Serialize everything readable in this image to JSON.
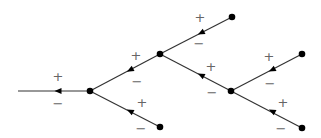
{
  "diagram": {
    "type": "binary-tree-signed-edges",
    "colors": {
      "edge": "#333333",
      "node": "#000000",
      "label": "#666666",
      "background": "#ffffff"
    },
    "nodes": [
      {
        "id": "root",
        "x": 90,
        "y": 91
      },
      {
        "id": "B",
        "x": 160,
        "y": 54
      },
      {
        "id": "C",
        "x": 231,
        "y": 91
      },
      {
        "id": "leaf1",
        "x": 232,
        "y": 17
      },
      {
        "id": "leaf2",
        "x": 302,
        "y": 54
      },
      {
        "id": "leaf3",
        "x": 302,
        "y": 128
      },
      {
        "id": "leaf4",
        "x": 160,
        "y": 127
      }
    ],
    "edges": [
      {
        "id": "stem",
        "from": [
          89,
          91
        ],
        "to": [
          18,
          91
        ],
        "arrow": [
          58,
          91
        ],
        "plus": {
          "text": "+",
          "x": 58,
          "y": 76
        },
        "minus": {
          "text": "−",
          "x": 58,
          "y": 103
        }
      },
      {
        "id": "B-root",
        "from": [
          160,
          54
        ],
        "to": [
          90,
          91
        ],
        "arrow": [
          130,
          70
        ],
        "plus": {
          "text": "+",
          "x": 136,
          "y": 55
        },
        "minus": {
          "text": "−",
          "x": 137,
          "y": 81
        }
      },
      {
        "id": "leaf4-root",
        "from": [
          160,
          127
        ],
        "to": [
          90,
          91
        ],
        "arrow": [
          130,
          111
        ],
        "plus": {
          "text": "+",
          "x": 142,
          "y": 102
        },
        "minus": {
          "text": "−",
          "x": 141,
          "y": 128
        }
      },
      {
        "id": "leaf1-B",
        "from": [
          232,
          17
        ],
        "to": [
          160,
          54
        ],
        "arrow": [
          201,
          33
        ],
        "plus": {
          "text": "+",
          "x": 200,
          "y": 17
        },
        "minus": {
          "text": "−",
          "x": 199,
          "y": 43
        }
      },
      {
        "id": "C-B",
        "from": [
          231,
          91
        ],
        "to": [
          160,
          54
        ],
        "arrow": [
          201,
          75
        ],
        "plus": {
          "text": "+",
          "x": 211,
          "y": 66
        },
        "minus": {
          "text": "−",
          "x": 212,
          "y": 92
        }
      },
      {
        "id": "leaf2-C",
        "from": [
          302,
          54
        ],
        "to": [
          231,
          91
        ],
        "arrow": [
          272,
          70
        ],
        "plus": {
          "text": "+",
          "x": 269,
          "y": 56
        },
        "minus": {
          "text": "−",
          "x": 270,
          "y": 83
        }
      },
      {
        "id": "leaf3-C",
        "from": [
          302,
          128
        ],
        "to": [
          231,
          91
        ],
        "arrow": [
          272,
          111
        ],
        "plus": {
          "text": "+",
          "x": 283,
          "y": 102
        },
        "minus": {
          "text": "−",
          "x": 281,
          "y": 128
        }
      }
    ]
  }
}
